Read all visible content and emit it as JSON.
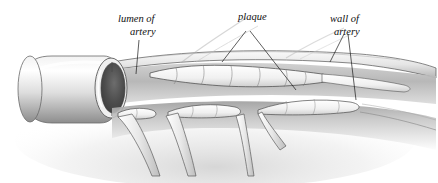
{
  "figure": {
    "background_color": "#ffffff",
    "ink_color": "#1a1a1a",
    "style": "pencil/stipple medical illustration, grayscale"
  },
  "labels": [
    {
      "id": "lumen",
      "name": "lumen-of-artery-label",
      "line1": "lumen of",
      "line2": "artery",
      "x": 118,
      "y": 22,
      "leaders": 1
    },
    {
      "id": "plaque",
      "name": "plaque-label",
      "line1": "plaque",
      "line2": "",
      "x": 238,
      "y": 20,
      "leaders": 2
    },
    {
      "id": "wall",
      "name": "wall-of-artery-label",
      "line1": "wall of",
      "line2": "artery",
      "x": 330,
      "y": 22,
      "leaders": 2
    }
  ],
  "structures": [
    {
      "id": "artery-trunk",
      "label": "main artery trunk (cut open)"
    },
    {
      "id": "lumen-opening",
      "label": "elliptical cut end showing lumen"
    },
    {
      "id": "plaque-upper",
      "label": "lobulated plaque along upper inner wall"
    },
    {
      "id": "plaque-branch-1",
      "label": "plaque at first branch ostium"
    },
    {
      "id": "plaque-branch-2",
      "label": "plaque at second branch ostium"
    },
    {
      "id": "branch-vessel-1",
      "label": "first descending branch vessel"
    },
    {
      "id": "branch-vessel-2",
      "label": "second descending branch vessel"
    },
    {
      "id": "branch-vessel-3",
      "label": "third descending branch vessel"
    },
    {
      "id": "wall-shadow",
      "label": "shaded posterior arterial wall"
    }
  ],
  "palette": {
    "white": "#ffffff",
    "paper": "#fbfbfb",
    "light_gray": "#e3e3e3",
    "mid_gray": "#b8b8b8",
    "dark_gray": "#6e6e6e",
    "deep": "#3a3a3a",
    "lumen_dark": "#4a4a4a",
    "outline": "#2a2a2a"
  }
}
